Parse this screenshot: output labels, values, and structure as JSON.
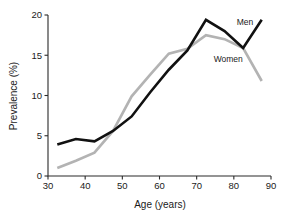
{
  "chart_data": {
    "type": "line",
    "title": "",
    "xlabel": "Age (years)",
    "ylabel": "Prevalence (%)",
    "xlim": [
      30,
      90
    ],
    "ylim": [
      0,
      20
    ],
    "xticks": [
      30,
      40,
      50,
      60,
      70,
      80,
      90
    ],
    "yticks": [
      0,
      5,
      10,
      15,
      20
    ],
    "grid": false,
    "legend_position": "inline-annotation",
    "x": [
      32.5,
      37.5,
      42.5,
      47.5,
      52.5,
      57.5,
      62.5,
      67.5,
      72.5,
      77.5,
      82.5,
      87.5
    ],
    "series": [
      {
        "name": "Men",
        "color": "#111111",
        "linewidth": 2.6,
        "values": [
          3.9,
          4.6,
          4.3,
          5.6,
          7.4,
          10.4,
          13.2,
          15.6,
          19.4,
          18.0,
          15.9,
          19.4
        ]
      },
      {
        "name": "Women",
        "color": "#b3b3b3",
        "linewidth": 2.6,
        "values": [
          1.0,
          1.9,
          2.9,
          5.6,
          9.9,
          12.6,
          15.2,
          15.8,
          17.5,
          17.0,
          15.9,
          11.8
        ]
      }
    ],
    "annotations": [
      {
        "text": "Men",
        "x": 83.0,
        "y": 18.8
      },
      {
        "text": "Women",
        "x": 78.5,
        "y": 14.2
      }
    ]
  },
  "ticks": {
    "x": [
      "30",
      "40",
      "50",
      "60",
      "70",
      "80",
      "90"
    ],
    "y": [
      "0",
      "5",
      "10",
      "15",
      "20"
    ]
  },
  "axes": {
    "x_title": "Age (years)",
    "y_title": "Prevalence (%)"
  },
  "series_labels": {
    "men": "Men",
    "women": "Women"
  }
}
